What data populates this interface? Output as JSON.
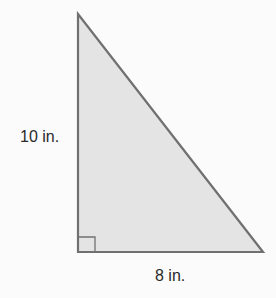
{
  "diagram": {
    "shape": "right-triangle",
    "labels": {
      "height": "10 in.",
      "base": "8 in."
    },
    "colors": {
      "fill": "#e4e4e4",
      "stroke": "#707070",
      "text": "#2a2a2a",
      "background": "#fbfbfb"
    },
    "right_angle_marker": true
  }
}
